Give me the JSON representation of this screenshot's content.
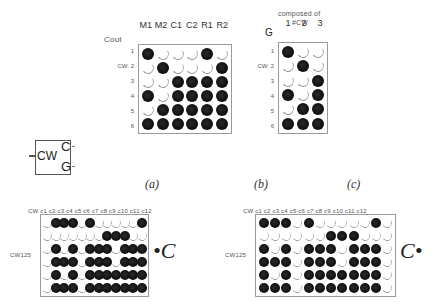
{
  "panel_a": {
    "corner_label": "Cout",
    "col_labels": [
      "M1",
      "M2",
      "C1",
      "C2",
      "R1",
      "R2"
    ],
    "row_labels": [
      "1",
      "CW: 2",
      "3",
      "4",
      "5",
      "6"
    ],
    "cells": [
      [
        1,
        0,
        0,
        0,
        1,
        0
      ],
      [
        0,
        1,
        0,
        0,
        0,
        1
      ],
      [
        0,
        0,
        1,
        1,
        1,
        1
      ],
      [
        1,
        0,
        1,
        1,
        1,
        1
      ],
      [
        0,
        1,
        1,
        1,
        1,
        1
      ],
      [
        1,
        1,
        1,
        1,
        1,
        1
      ]
    ],
    "caption": "(a)"
  },
  "block": {
    "input_label": "CW",
    "output_top": "C",
    "output_bottom": "G",
    "caption": "(b)"
  },
  "panel_c": {
    "title_line1": "composed of",
    "title_line2": "#CW",
    "corner_label": "G",
    "col_labels": [
      "1",
      "2",
      "3"
    ],
    "row_labels": [
      "1",
      "CW: 2",
      "3",
      "4",
      "5",
      "6"
    ],
    "cells": [
      [
        1,
        0,
        0
      ],
      [
        0,
        1,
        0
      ],
      [
        0,
        0,
        1
      ],
      [
        1,
        0,
        1
      ],
      [
        0,
        1,
        1
      ],
      [
        1,
        1,
        1
      ]
    ],
    "caption": "(c)"
  },
  "panel_d": {
    "header": "CW  c1  c2  c3  c4  c5  c6  c7  c8  c9  c10 c11 c12",
    "row_label": "CW125",
    "side_label": "•C",
    "cells": [
      [
        0,
        1,
        1,
        1,
        0,
        1,
        0,
        0,
        0,
        0,
        0,
        1
      ],
      [
        0,
        0,
        0,
        0,
        0,
        0,
        0,
        1,
        1,
        1,
        0,
        0
      ],
      [
        0,
        1,
        0,
        1,
        0,
        1,
        1,
        1,
        0,
        1,
        1,
        1
      ],
      [
        0,
        1,
        1,
        1,
        0,
        1,
        1,
        1,
        0,
        1,
        1,
        1
      ],
      [
        0,
        1,
        0,
        1,
        0,
        1,
        1,
        1,
        1,
        1,
        1,
        1
      ],
      [
        0,
        1,
        1,
        1,
        0,
        1,
        1,
        1,
        1,
        1,
        1,
        1
      ]
    ]
  },
  "panel_e": {
    "header": "CW  c1  c2  c3  c4  c5  c6  c7  c8  c9  c10 c11 c12",
    "row_label": "CW125",
    "side_label": "C•",
    "cells": [
      [
        1,
        1,
        1,
        0,
        1,
        0,
        0,
        0,
        0,
        0,
        1,
        0
      ],
      [
        0,
        0,
        0,
        0,
        0,
        0,
        1,
        1,
        1,
        0,
        0,
        0
      ],
      [
        1,
        0,
        1,
        0,
        1,
        1,
        1,
        0,
        1,
        1,
        1,
        0
      ],
      [
        1,
        1,
        1,
        0,
        1,
        1,
        1,
        0,
        1,
        1,
        1,
        0
      ],
      [
        1,
        0,
        1,
        0,
        1,
        1,
        1,
        1,
        1,
        1,
        1,
        0
      ],
      [
        1,
        1,
        1,
        0,
        1,
        1,
        1,
        1,
        1,
        1,
        1,
        0
      ]
    ]
  }
}
